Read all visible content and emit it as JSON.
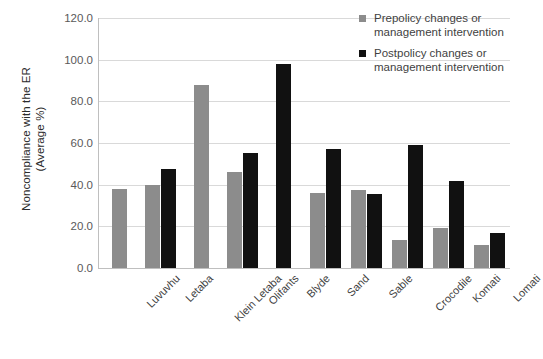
{
  "chart_data": {
    "type": "bar",
    "title": "",
    "xlabel": "",
    "ylabel": "Noncompliance with the ER\n(Average %)",
    "ylim": [
      0,
      120
    ],
    "ytick_step": 20,
    "yticks": [
      "0.0",
      "20.0",
      "40.0",
      "60.0",
      "80.0",
      "100.0",
      "120.0"
    ],
    "grid": true,
    "legend_position": "top-right",
    "categories": [
      "Luvuvhu",
      "Letaba",
      "Klein Letaba",
      "Olifants",
      "Blyde",
      "Sand",
      "Sable",
      "Crocodile",
      "Komati",
      "Lomati"
    ],
    "series": [
      {
        "name": "Prepolicy changes or\nmanagement intervention",
        "color": "#8c8c8c",
        "values": [
          38,
          40,
          88,
          46,
          null,
          36,
          37.5,
          13.5,
          19,
          11
        ]
      },
      {
        "name": "Postpolicy changes or\nmanagement intervention",
        "color": "#111111",
        "values": [
          null,
          47.5,
          null,
          55,
          98,
          57,
          35.5,
          59,
          42,
          17
        ]
      }
    ]
  },
  "legend": {
    "items": [
      {
        "label": "Prepolicy changes or\nmanagement intervention",
        "swatch": "pre"
      },
      {
        "label": "Postpolicy changes or\nmanagement intervention",
        "swatch": "post"
      }
    ]
  }
}
